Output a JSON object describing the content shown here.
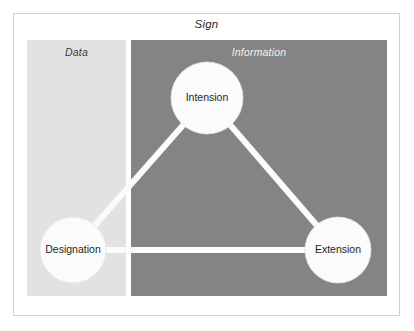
{
  "figure": {
    "title": "Sign",
    "panels": [
      {
        "key": "data",
        "label": "Data",
        "color": "#e2e2e2"
      },
      {
        "key": "information",
        "label": "Information",
        "color": "#848484"
      }
    ],
    "nodes": [
      {
        "key": "intension",
        "label": "Intension",
        "cx": 207,
        "cy": 98,
        "r": 36,
        "color": "#fbfbfb"
      },
      {
        "key": "designation",
        "label": "Designation",
        "cx": 73,
        "cy": 250,
        "r": 33,
        "color": "#fbfbfb"
      },
      {
        "key": "extension",
        "label": "Extension",
        "cx": 338,
        "cy": 250,
        "r": 33,
        "color": "#fbfbfb"
      }
    ],
    "edges": [
      {
        "key": "designation-intension",
        "from": "designation",
        "to": "intension",
        "color": "#fbfbfb"
      },
      {
        "key": "intension-extension",
        "from": "intension",
        "to": "extension",
        "color": "#fbfbfb"
      },
      {
        "key": "designation-extension",
        "from": "designation",
        "to": "extension",
        "color": "#fbfbfb"
      }
    ],
    "frame_color": "#d2d2d2",
    "background": "#ffffff"
  }
}
